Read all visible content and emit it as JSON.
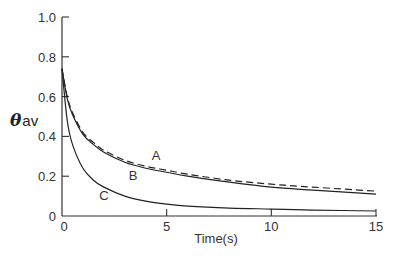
{
  "chart_data": {
    "type": "line",
    "title": "",
    "xlabel": "Time(s)",
    "ylabel": "θav",
    "ylabel_main": "θ",
    "ylabel_sub": "av",
    "xlim": [
      0,
      15
    ],
    "ylim": [
      0,
      1.0
    ],
    "grid": false,
    "legend": "inline curve labels",
    "x_ticks": [
      0,
      5,
      10,
      15
    ],
    "x_tick_labels": [
      "0",
      "5",
      "10",
      "15"
    ],
    "y_ticks": [
      0,
      0.2,
      0.4,
      0.6,
      0.8,
      1.0
    ],
    "y_tick_labels": [
      "0",
      "0.2",
      "0.4",
      "0.6",
      "0.8",
      "1.0"
    ],
    "series": [
      {
        "name": "A",
        "style": "dashed",
        "x": [
          0,
          0.25,
          0.5,
          1,
          1.5,
          2,
          3,
          4,
          5,
          6,
          8,
          10,
          12,
          15
        ],
        "y": [
          0.74,
          0.6,
          0.52,
          0.42,
          0.37,
          0.33,
          0.28,
          0.25,
          0.23,
          0.21,
          0.18,
          0.16,
          0.145,
          0.125
        ]
      },
      {
        "name": "B",
        "style": "solid",
        "x": [
          0,
          0.25,
          0.5,
          1,
          1.5,
          2,
          3,
          4,
          5,
          6,
          8,
          10,
          12,
          15
        ],
        "y": [
          0.74,
          0.59,
          0.51,
          0.41,
          0.36,
          0.32,
          0.27,
          0.24,
          0.22,
          0.2,
          0.17,
          0.145,
          0.13,
          0.11
        ]
      },
      {
        "name": "C",
        "style": "solid",
        "x": [
          0,
          0.25,
          0.5,
          1,
          1.5,
          2,
          3,
          4,
          5,
          6,
          8,
          10,
          12,
          15
        ],
        "y": [
          0.74,
          0.48,
          0.36,
          0.24,
          0.18,
          0.145,
          0.1,
          0.075,
          0.06,
          0.05,
          0.04,
          0.035,
          0.03,
          0.025
        ]
      }
    ],
    "annotations": [
      {
        "text": "A",
        "x": 4.5,
        "y": 0.28
      },
      {
        "text": "B",
        "x": 3.4,
        "y": 0.18
      },
      {
        "text": "C",
        "x": 2.0,
        "y": 0.08
      }
    ]
  }
}
